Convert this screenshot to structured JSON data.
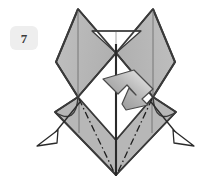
{
  "figure": {
    "kind": "origami-fold-diagram",
    "step_number": "7",
    "background_color": "#ffffff",
    "paper_fill": "#b5b5b5",
    "paper_fill_light": "#c4c4c4",
    "paper_fill_shade": "#a8a8a8",
    "paper_back_fill": "#ffffff",
    "outline_color": "#3a3a3a",
    "thin_line_color": "#6f6f6f",
    "fold_line_color": "#1f1f1f",
    "push_arrow_light": "#e2e2e2",
    "push_arrow_dark": "#8d8d8d",
    "hollow_arrow_fill": "#ffffff",
    "badge_bg": "#eeeeee",
    "badge_text_color": "#3a3a3a"
  },
  "shapes": {
    "upper_left_wing": {
      "name": "upper-left-wing-flap",
      "points": "78,9 116,53 78,97 56,62",
      "fill": "#b5b5b5"
    },
    "upper_right_wing": {
      "name": "upper-right-wing-flap",
      "points": "153,9 175,62 153,97 116,53",
      "fill": "#b5b5b5"
    },
    "lower_left_wing": {
      "name": "lower-left-wing-flap",
      "points": "78,97 116,140 116,175 55,112",
      "fill": "#b5b5b5"
    },
    "lower_right_wing": {
      "name": "lower-right-wing-flap",
      "points": "153,97 176,112 116,175 116,140",
      "fill": "#b5b5b5"
    },
    "center_white_panel": {
      "name": "center-white-panel",
      "points": "116,53 153,97 116,140 78,97",
      "fill": "#ffffff"
    },
    "top_white_trapezoid": {
      "name": "top-white-trapezoid",
      "points": "92,31 141,31 116,53",
      "fill": "#ffffff"
    }
  },
  "lines": {
    "center_vertical_axis": {
      "name": "center-vertical-axis",
      "x1": 116,
      "y1": 31,
      "x2": 116,
      "y2": 175,
      "width": 2.0
    },
    "left_wing_crease": {
      "name": "left-wing-center-crease",
      "x1": 78,
      "y1": 9,
      "x2": 78,
      "y2": 97,
      "width": 0.9
    },
    "right_wing_crease": {
      "name": "right-wing-center-crease",
      "x1": 153,
      "y1": 9,
      "x2": 153,
      "y2": 97,
      "width": 0.9
    },
    "lower_left_crease": {
      "name": "lower-left-center-crease",
      "x1": 78,
      "y1": 97,
      "x2": 78,
      "y2": 133,
      "width": 0.9
    },
    "lower_right_crease": {
      "name": "lower-right-center-crease",
      "x1": 153,
      "y1": 97,
      "x2": 153,
      "y2": 133,
      "width": 0.9
    },
    "top_trapezoid_bar": {
      "name": "top-trapezoid-horizontal-edge",
      "x1": 92,
      "y1": 31,
      "x2": 141,
      "y2": 31,
      "width": 1.2
    },
    "top_trapezoid_tick": {
      "name": "top-trapezoid-center-tick",
      "x1": 116,
      "y1": 31,
      "x2": 116,
      "y2": 42,
      "width": 0.8
    }
  },
  "fold_lines": {
    "left_dash_dot": {
      "name": "left-valley-fold-line",
      "path": "M 78,97 L 116,175",
      "dash": "7,3,1.5,3"
    },
    "right_dash_dot": {
      "name": "right-valley-fold-line",
      "path": "M 153,97 L 116,175",
      "dash": "7,3,1.5,3"
    }
  },
  "curved_edges": {
    "left_curve": {
      "name": "lower-left-curved-edge",
      "path": "M 78,97 Q 76,128 55,112"
    },
    "right_curve": {
      "name": "lower-right-curved-edge",
      "path": "M 153,97 Q 155,128 176,112"
    }
  },
  "arrows": {
    "push_arrow": {
      "name": "push-fold-arrow",
      "direction": "down-left",
      "body_path": "M 136,71 L 152,87 L 142,97 L 149,104 L 128,108 L 126,106 L 131,88 L 137,94 L 127,84 L 118,93 L 104,79 Z",
      "fill_from": "#efefef",
      "fill_to": "#8a8a8a"
    },
    "left_pull_arrow": {
      "name": "left-pull-out-arrow",
      "line_path": "M 79,103 L 54,133",
      "head_points": "38,144 57,131 56,142",
      "fill": "#ffffff"
    },
    "right_pull_arrow": {
      "name": "right-pull-out-arrow",
      "line_path": "M 152,103 L 177,133",
      "head_points": "193,144 174,131 175,142",
      "fill": "#ffffff"
    }
  },
  "badge": {
    "label": "7",
    "shape": "rounded-square"
  }
}
